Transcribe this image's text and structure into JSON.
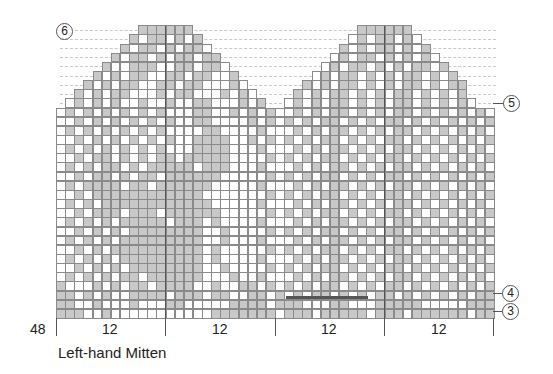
{
  "chart_data": {
    "type": "table",
    "title": "Left-hand Mitten",
    "total_stitches": 48,
    "stitch_count_label": "48",
    "sections": [
      {
        "label": "12"
      },
      {
        "label": "12"
      },
      {
        "label": "12"
      },
      {
        "label": "12"
      }
    ],
    "row_markers": [
      {
        "label": "6",
        "side": "left",
        "row": 31
      },
      {
        "label": "5",
        "side": "right",
        "row": 22
      },
      {
        "label": "4",
        "side": "right",
        "row": 2
      },
      {
        "label": "3",
        "side": "right",
        "row": 0
      }
    ],
    "colors": {
      "background": "#ffffff",
      "contrast": "#c8c8c8",
      "grid": "#8a8a8a",
      "outline": "#555555"
    },
    "legend_key": {
      "0": "main color (white)",
      "1": "contrast color (gray)",
      ".": "no stitch"
    },
    "rows_top_to_bottom": [
      ".........111111..................111111.........",
      "........10110101................01011010........",
      ".......1011010110..............1010110101.......",
      "......101101011011............010110101010......",
      ".....10011100110110..........01011010101101.....",
      "....1010110011011001........0101101010110101....",
      "...101011001101100010......101011010101101011...",
      "..10101100010110001010....1010110101011010101...",
      ".0101010010010011000101..010101101010110101010..",
      "010101010101000110010101001010110101011010101010",
      "001010101010100110000101010101101010110101010101",
      "010101010101000011000010001010110101011010101010",
      "001010101010100111100101010101101010110101010101",
      "010101010101000111100010001010110101011010101010",
      "001011010101101111100001010101101010110101010101",
      "010101101011111011100010001010110101011010101010",
      "001011010110111111000001010101101010110101010101",
      "010111101101111110000010001010110101011010101010",
      "001011111111111100000001010101101010110101010101",
      "010101111111111110000010001010110101011010101010",
      "001011101110111111000001010101101010110101010101",
      "010101011111011101000010001010110101011010101010",
      "001010101111111100100001010101101010110101010101",
      "010101011111111100100010001010110101011010101010",
      "001010111111111101000001010101101010110101010101",
      "010101011111111101000010001010110101011010101010",
      "001010101111111100100001010101101010110101010101",
      "010101011011111100010010001010110101011010101010",
      "100010101101111001001101010101101010110101010101",
      "110101001111011101100110101011010101101010101011",
      "110010001000110000011110111000110001111100000111",
      "111001000000000001111111011101111101110111111011"
    ]
  },
  "labels": {
    "stitch_total": "48",
    "section_1": "12",
    "section_2": "12",
    "section_3": "12",
    "section_4": "12",
    "caption": "Left-hand Mitten",
    "marker_6": "6",
    "marker_5": "5",
    "marker_4": "4",
    "marker_3": "3"
  }
}
